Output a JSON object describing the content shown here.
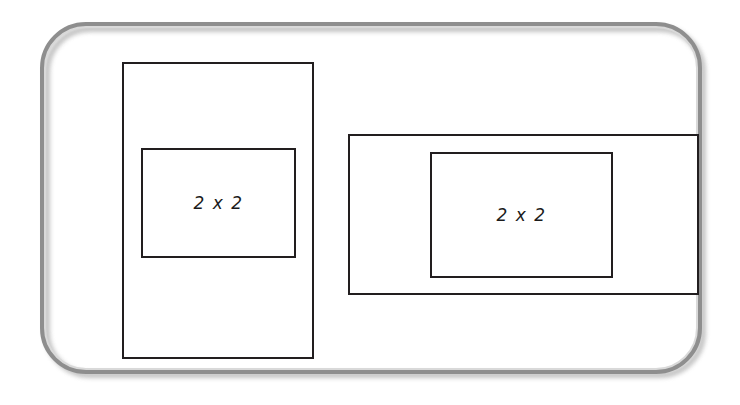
{
  "canvas": {
    "width": 740,
    "height": 405,
    "background": "#ffffff"
  },
  "frame": {
    "name": "rounded-slide-frame",
    "border_color": "#8e8e8e",
    "inner_highlight_color": "#d9d9d9",
    "shadow_color": "#b9b9b9",
    "corner_radius": 46
  },
  "style": {
    "rect_stroke": "#221e1f",
    "rect_fill": "#ffffff",
    "label_color": "#1b1b1b"
  },
  "figures": [
    {
      "id": "left",
      "orientation": "portrait",
      "outer": {
        "label": "",
        "x": 122,
        "y": 62,
        "width": 192,
        "height": 297
      },
      "inner": {
        "label": "2 x 2",
        "x": 141,
        "y": 148,
        "width": 155,
        "height": 110
      }
    },
    {
      "id": "right",
      "orientation": "landscape",
      "outer": {
        "label": "",
        "x": 348,
        "y": 134,
        "width": 351,
        "height": 161
      },
      "inner": {
        "label": "2 x 2",
        "x": 430,
        "y": 152,
        "width": 183,
        "height": 126
      }
    }
  ]
}
